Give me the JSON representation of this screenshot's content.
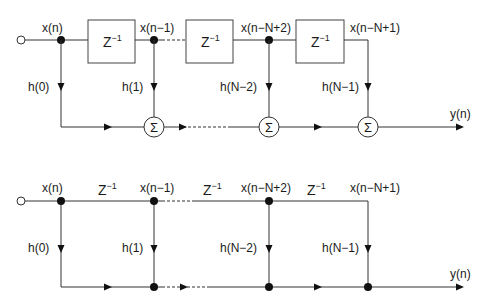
{
  "top_diagram": {
    "input_label": "x(n)",
    "delay_label": "Z",
    "delay_exp": "−1",
    "taps": [
      {
        "node": "x(n)",
        "coef": "h(0)"
      },
      {
        "node": "x(n−1)",
        "coef": "h(1)"
      },
      {
        "node": "x(n−N+2)",
        "coef": "h(N−2)"
      },
      {
        "node": "x(n−N+1)",
        "coef": "h(N−1)"
      }
    ],
    "sum_symbol": "Σ",
    "output_label": "y(n)"
  },
  "bottom_diagram": {
    "delay_label": "Z",
    "delay_exp": "−1",
    "taps": [
      {
        "node": "x(n)",
        "coef": "h(0)"
      },
      {
        "node": "x(n−1)",
        "coef": "h(1)"
      },
      {
        "node": "x(n−N+2)",
        "coef": "h(N−2)"
      },
      {
        "node": "x(n−N+1)",
        "coef": "h(N−1)"
      }
    ],
    "output_label": "y(n)"
  }
}
